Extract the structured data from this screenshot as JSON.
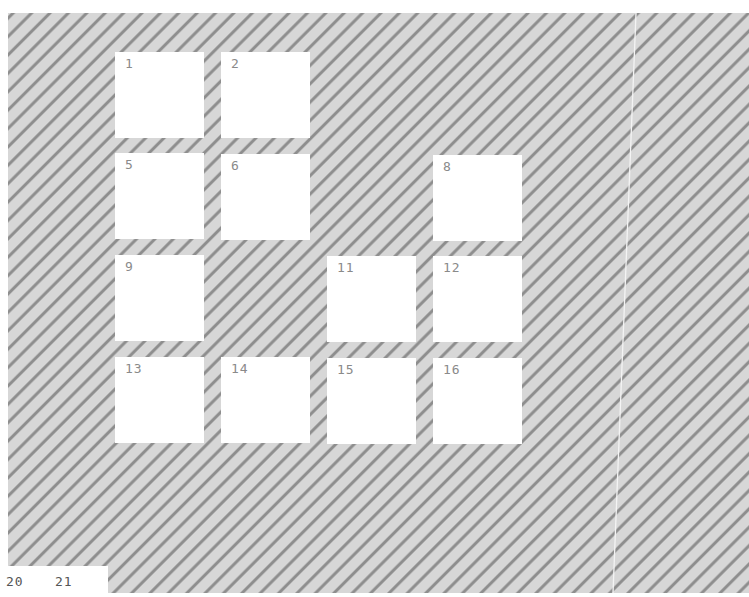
{
  "workspace": {
    "background_color": "#d7d7d7",
    "stripe_color": "#8e8e8e",
    "tile_color": "#ffffff",
    "label_color": "#8a8a8a"
  },
  "tiles": [
    {
      "label": "1",
      "x": 115,
      "y": 52
    },
    {
      "label": "2",
      "x": 221,
      "y": 52
    },
    {
      "label": "5",
      "x": 115,
      "y": 153
    },
    {
      "label": "6",
      "x": 221,
      "y": 154
    },
    {
      "label": "8",
      "x": 433,
      "y": 155
    },
    {
      "label": "9",
      "x": 115,
      "y": 255
    },
    {
      "label": "11",
      "x": 327,
      "y": 256
    },
    {
      "label": "12",
      "x": 433,
      "y": 256
    },
    {
      "label": "13",
      "x": 115,
      "y": 357
    },
    {
      "label": "14",
      "x": 221,
      "y": 357
    },
    {
      "label": "15",
      "x": 327,
      "y": 358
    },
    {
      "label": "16",
      "x": 433,
      "y": 358
    }
  ],
  "footer": {
    "items": [
      {
        "label": "20"
      },
      {
        "label": "21"
      }
    ]
  }
}
